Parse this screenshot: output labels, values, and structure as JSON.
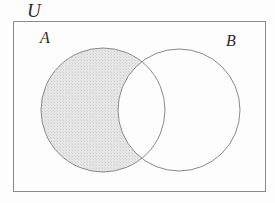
{
  "figure": {
    "type": "venn-diagram",
    "shaded_region": "A minus B",
    "background_color": "#fdfdfd"
  },
  "labels": {
    "universe": "U",
    "set_a": "A",
    "set_b": "B"
  },
  "universe_box": {
    "name": "universal-set-rectangle",
    "x": 13,
    "y": 21,
    "width": 253,
    "height": 171,
    "stroke_color": "#8a8a8a",
    "stroke_width": 1,
    "fill_color": "#fdfdfd"
  },
  "circles": [
    {
      "name": "circle-a",
      "label": "A",
      "cx": 103,
      "cy": 110,
      "r": 62,
      "stroke_color": "#8a8a8a",
      "stroke_width": 1,
      "fill_color": "none"
    },
    {
      "name": "circle-b",
      "label": "B",
      "cx": 179,
      "cy": 110,
      "r": 61,
      "stroke_color": "#8a8a8a",
      "stroke_width": 1,
      "fill_color": "none"
    }
  ],
  "shading": {
    "name": "shaded-a-minus-b",
    "pattern": "fine-dotted-crosshatch",
    "fill_color": "#e4e4e4",
    "dot_color": "#d2d2d2"
  },
  "chart_data": {
    "type": "diagram",
    "title": "",
    "sets": [
      "A",
      "B"
    ],
    "universe": "U",
    "regions": [
      {
        "id": "A_only",
        "expression": "A - B",
        "shaded": true
      },
      {
        "id": "A_and_B",
        "expression": "A ∩ B",
        "shaded": false
      },
      {
        "id": "B_only",
        "expression": "B - A",
        "shaded": false
      },
      {
        "id": "outside",
        "expression": "U - (A ∪ B)",
        "shaded": false
      }
    ]
  }
}
